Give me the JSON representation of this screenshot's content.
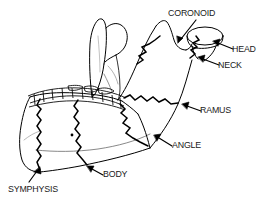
{
  "figure": {
    "background_color": "#ffffff",
    "line_color": "#000000",
    "text_color": "#1a1a1a",
    "labels": [
      {
        "id": "coronoid",
        "text": "CORONOID",
        "arrow_from": [
          196,
          20
        ],
        "arrow_to": [
          178,
          42
        ]
      },
      {
        "id": "head",
        "text": "HEAD",
        "arrow_from": [
          231,
          48
        ],
        "arrow_to": [
          213,
          42
        ]
      },
      {
        "id": "neck",
        "text": "NECK",
        "arrow_from": [
          217,
          64
        ],
        "arrow_to": [
          199,
          58
        ]
      },
      {
        "id": "ramus",
        "text": "RAMUS",
        "arrow_from": [
          199,
          110
        ],
        "arrow_to": [
          183,
          104
        ]
      },
      {
        "id": "angle",
        "text": "ANGLE",
        "arrow_from": [
          171,
          145
        ],
        "arrow_to": [
          155,
          135
        ]
      },
      {
        "id": "body",
        "text": "BODY",
        "arrow_from": [
          102,
          174
        ],
        "arrow_to": [
          88,
          166
        ]
      },
      {
        "id": "symphysis",
        "text": "SYMPHYSIS",
        "arrow_from": [
          30,
          181
        ],
        "arrow_to": [
          38,
          168
        ]
      }
    ],
    "fracture_segments": [
      "symphysis",
      "body",
      "angle",
      "ramus",
      "neck",
      "head",
      "coronoid"
    ]
  }
}
